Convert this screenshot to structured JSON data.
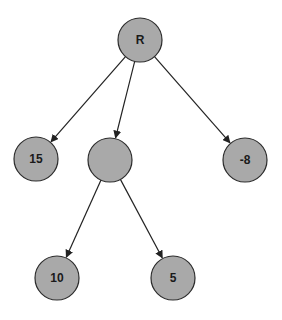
{
  "diagram": {
    "type": "tree",
    "colors": {
      "node_fill": "#a9a9a9",
      "node_stroke": "#2b2b2b",
      "edge": "#222222",
      "background": "#ffffff"
    },
    "nodes": [
      {
        "id": "root",
        "label": "R",
        "cx": 140,
        "cy": 40,
        "r": 22
      },
      {
        "id": "n15",
        "label": "15",
        "cx": 36,
        "cy": 159,
        "r": 22
      },
      {
        "id": "nmid",
        "label": "",
        "cx": 110,
        "cy": 160,
        "r": 22
      },
      {
        "id": "nm8",
        "label": "-8",
        "cx": 245,
        "cy": 160,
        "r": 22
      },
      {
        "id": "n10",
        "label": "10",
        "cx": 57,
        "cy": 278,
        "r": 22
      },
      {
        "id": "n5",
        "label": "5",
        "cx": 173,
        "cy": 278,
        "r": 22
      }
    ],
    "edges": [
      {
        "from": "root",
        "to": "n15"
      },
      {
        "from": "root",
        "to": "nmid"
      },
      {
        "from": "root",
        "to": "nm8"
      },
      {
        "from": "nmid",
        "to": "n10"
      },
      {
        "from": "nmid",
        "to": "n5"
      }
    ]
  }
}
